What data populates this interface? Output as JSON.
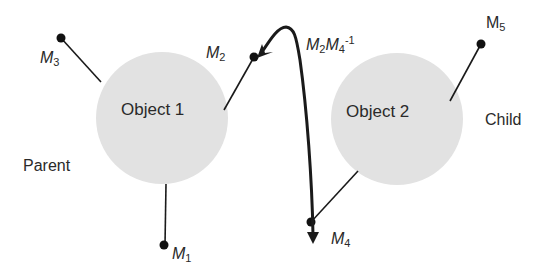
{
  "diagram": {
    "objects": [
      {
        "id": "object-1",
        "label": "Object 1",
        "cx": 162,
        "cy": 118,
        "r": 66,
        "fill": "#e2e2e2"
      },
      {
        "id": "object-2",
        "label": "Object 2",
        "cx": 397,
        "cy": 119,
        "r": 66,
        "fill": "#e2e2e2"
      }
    ],
    "side_labels": {
      "parent": "Parent",
      "child": "Child"
    },
    "markers": [
      {
        "id": "M1",
        "base": "M",
        "sub": "1"
      },
      {
        "id": "M2",
        "base": "M",
        "sub": "2"
      },
      {
        "id": "M3",
        "base": "M",
        "sub": "3"
      },
      {
        "id": "M4",
        "base": "M",
        "sub": "4"
      },
      {
        "id": "M5",
        "base": "M",
        "sub": "5"
      }
    ],
    "transform_label": {
      "a_base": "M",
      "a_sub": "2",
      "b_base": "M",
      "b_sub": "4",
      "sup": "-1"
    },
    "colors": {
      "circle_fill": "#e2e2e2",
      "line": "#1a1a1a",
      "text": "#2a2a2a"
    }
  }
}
